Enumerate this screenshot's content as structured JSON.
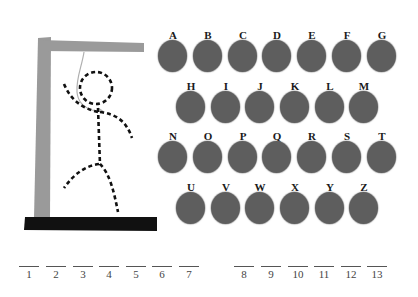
{
  "game": {
    "name": "Hangman",
    "colors": {
      "gallows": "#9a9a9a",
      "base": "#111111",
      "figure": "#111111",
      "rope": "#b0b0b0",
      "letter_button": "#5e5e5e",
      "letter_text": "#1a1a1a"
    }
  },
  "keyboard": {
    "rows": [
      [
        "A",
        "B",
        "C",
        "D",
        "E",
        "F",
        "G"
      ],
      [
        "H",
        "I",
        "J",
        "K",
        "L",
        "M"
      ],
      [
        "N",
        "O",
        "P",
        "Q",
        "R",
        "S",
        "T"
      ],
      [
        "U",
        "V",
        "W",
        "X",
        "Y",
        "Z"
      ]
    ]
  },
  "word": {
    "groups": [
      {
        "slots": [
          "1",
          "2",
          "3",
          "4",
          "5",
          "6",
          "7"
        ]
      },
      {
        "slots": [
          "8",
          "9",
          "10",
          "11",
          "12",
          "13"
        ]
      }
    ],
    "total_letters": 13
  }
}
